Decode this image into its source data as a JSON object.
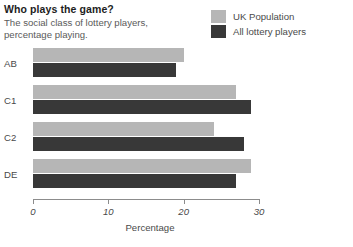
{
  "header": {
    "title": "Who plays the game?",
    "subtitle": "The social class of lottery players,\npercentage playing."
  },
  "legend": {
    "position": "top-right",
    "items": [
      {
        "label": "UK Population",
        "color": "#b6b6b6",
        "swatch_name": "legend-swatch-uk-population"
      },
      {
        "label": "All lottery players",
        "color": "#383838",
        "swatch_name": "legend-swatch-all-lottery-players"
      }
    ]
  },
  "colors": {
    "uk_population": "#b6b6b6",
    "all_lottery_players": "#383838",
    "axis": "#8c8c8c",
    "text": "#4a4a4a",
    "title": "#1d1d1d",
    "background": "#ffffff"
  },
  "chart_data": {
    "type": "bar",
    "orientation": "horizontal",
    "title": "Who plays the game?",
    "subtitle": "The social class of lottery players, percentage playing.",
    "xlabel": "Percentage",
    "ylabel": "",
    "categories": [
      "AB",
      "C1",
      "C2",
      "DE"
    ],
    "series": [
      {
        "name": "UK Population",
        "color": "#b6b6b6",
        "values": [
          20,
          27,
          24,
          29
        ]
      },
      {
        "name": "All lottery players",
        "color": "#383838",
        "values": [
          19,
          29,
          28,
          27
        ]
      }
    ],
    "xlim": [
      0,
      30
    ],
    "xticks": [
      0,
      10,
      20,
      30
    ],
    "xticklabels": [
      "0",
      "10",
      "20",
      "30"
    ],
    "grid": false,
    "legend_position": "top-right"
  }
}
